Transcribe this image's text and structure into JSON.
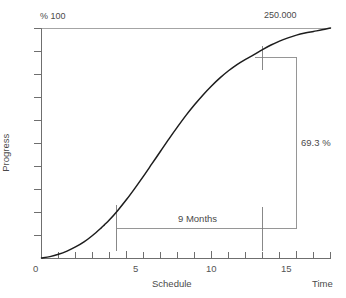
{
  "chart_data": {
    "type": "line",
    "title": "",
    "subtitle": "",
    "xlabel": "Schedule",
    "ylabel": "Progress",
    "axis_corner_labels": {
      "y_top": "% 100",
      "x_right": "Time",
      "top_right_total": "250.000"
    },
    "xlim": [
      0,
      17
    ],
    "ylim": [
      0,
      100
    ],
    "grid": false,
    "legend": null,
    "x_tick_labels": [
      "0",
      "5",
      "10",
      "15"
    ],
    "x_tick_values": [
      0,
      5,
      10,
      15
    ],
    "x_minor_tick_values": [
      1,
      2,
      3,
      4,
      6,
      7,
      8,
      9,
      11,
      12,
      13,
      14,
      16,
      17
    ],
    "y_tick_labels": [
      "",
      "",
      "",
      "",
      "",
      "",
      "",
      "",
      "",
      ""
    ],
    "y_tick_values": [
      10,
      20,
      30,
      40,
      50,
      60,
      70,
      80,
      90,
      100
    ],
    "series": [
      {
        "name": "Progress S-curve",
        "x": [
          0,
          0.5,
          1,
          1.5,
          2,
          2.5,
          3,
          3.5,
          3.7,
          4,
          4.5,
          5,
          5.5,
          6,
          6.5,
          7,
          7.5,
          8,
          8.5,
          9,
          9.5,
          10,
          10.5,
          11,
          11.5,
          12,
          12.5,
          13,
          13.5,
          14,
          14.5,
          15,
          15.5,
          16,
          16.5,
          17
        ],
        "y": [
          0,
          0.6,
          1.6,
          3.0,
          4.8,
          7.0,
          9.8,
          13.0,
          14.4,
          16.6,
          20.8,
          25.4,
          30.4,
          35.6,
          41.0,
          46.4,
          51.8,
          57.0,
          62.0,
          66.6,
          70.9,
          74.8,
          78.3,
          81.4,
          84.1,
          86.4,
          88.4,
          90.6,
          92.6,
          94.3,
          95.7,
          96.9,
          97.8,
          98.5,
          99.2,
          100
        ]
      }
    ],
    "annotations": [
      {
        "name": "vertical-drop-dimension",
        "label": "69.3 %",
        "value": 69.3,
        "unit": "%",
        "orientation": "vertical",
        "from_y": 88.4,
        "to_y": 19.1,
        "at_x": 14.7
      },
      {
        "name": "horizontal-duration-dimension",
        "label": "9 Months",
        "value": 9,
        "unit": "Months",
        "orientation": "horizontal",
        "from_x": 3.7,
        "to_x": 12.5,
        "at_y": 19.1
      }
    ],
    "markers": [
      {
        "name": "lower-curve-marker",
        "x": 3.7,
        "y": 19.1
      },
      {
        "name": "upper-curve-marker",
        "x": 12.5,
        "y": 88.4
      }
    ]
  },
  "colors": {
    "background": "#ffffff",
    "axis": "#6f6f6f",
    "curve": "#1d1d1d",
    "annotation": "#7a7a7a",
    "text": "#4a4a4a"
  }
}
